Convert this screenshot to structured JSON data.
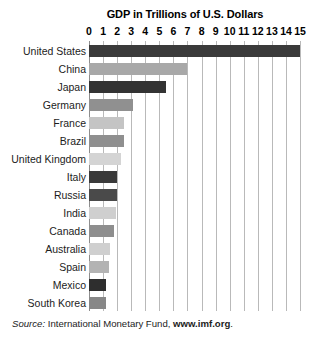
{
  "chart_data": {
    "type": "bar",
    "orientation": "horizontal",
    "title": "GDP in Trillions of U.S. Dollars",
    "xlabel": "",
    "ylabel": "",
    "xlim": [
      0,
      15
    ],
    "grid": true,
    "legend": "none",
    "tick_labels": [
      "0",
      "1",
      "2",
      "3",
      "4",
      "5",
      "6",
      "7",
      "8",
      "9",
      "10",
      "11",
      "12",
      "13",
      "14",
      "15"
    ],
    "tick_values": [
      0,
      1,
      2,
      3,
      4,
      5,
      6,
      7,
      8,
      9,
      10,
      11,
      12,
      13,
      14,
      15
    ],
    "categories": [
      "United States",
      "China",
      "Japan",
      "Germany",
      "France",
      "Brazil",
      "United Kingdom",
      "Italy",
      "Russia",
      "India",
      "Canada",
      "Australia",
      "Spain",
      "Mexico",
      "South Korea"
    ],
    "values": [
      15.0,
      7.0,
      5.5,
      3.1,
      2.5,
      2.5,
      2.3,
      2.0,
      2.0,
      1.9,
      1.8,
      1.5,
      1.4,
      1.2,
      1.2
    ],
    "bars": [
      {
        "label": "United States",
        "value": 15.0,
        "color": "#3a3a3a"
      },
      {
        "label": "China",
        "value": 7.0,
        "color": "#a8a8a8"
      },
      {
        "label": "Japan",
        "value": 5.5,
        "color": "#333333"
      },
      {
        "label": "Germany",
        "value": 3.1,
        "color": "#909090"
      },
      {
        "label": "France",
        "value": 2.5,
        "color": "#c4c4c4"
      },
      {
        "label": "Brazil",
        "value": 2.5,
        "color": "#8f8f8f"
      },
      {
        "label": "United Kingdom",
        "value": 2.3,
        "color": "#d4d4d4"
      },
      {
        "label": "Italy",
        "value": 2.0,
        "color": "#3a3a3a"
      },
      {
        "label": "Russia",
        "value": 2.0,
        "color": "#4a4a4a"
      },
      {
        "label": "India",
        "value": 1.9,
        "color": "#cfcfcf"
      },
      {
        "label": "Canada",
        "value": 1.8,
        "color": "#8e8e8e"
      },
      {
        "label": "Australia",
        "value": 1.5,
        "color": "#cfcfcf"
      },
      {
        "label": "Spain",
        "value": 1.4,
        "color": "#b3b3b3"
      },
      {
        "label": "Mexico",
        "value": 1.2,
        "color": "#2e2e2e"
      },
      {
        "label": "South Korea",
        "value": 1.2,
        "color": "#878787"
      }
    ]
  },
  "source": {
    "lead": "Source:",
    "body": " International Monetary Fund, ",
    "url": "www.imf.org",
    "period": "."
  },
  "colors": {
    "gridline": "#b9b9b9",
    "axis": "#8d8d8d",
    "background": "#ffffff",
    "text": "#1c1c1c"
  }
}
